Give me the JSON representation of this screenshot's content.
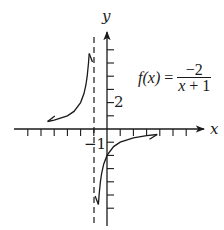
{
  "chart_data": {
    "type": "line",
    "title": "",
    "function_label": {
      "name": "f(x)",
      "equals": "=",
      "numerator": "−2",
      "denominator_var": "x",
      "denominator_rest": " + 1"
    },
    "xlabel": "x",
    "ylabel": "y",
    "tick_labels": {
      "y_2": "2",
      "x_neg1": "−1"
    },
    "grid": false,
    "legend": "none",
    "xlim": [
      -7,
      7
    ],
    "ylim": [
      -7,
      7
    ],
    "vertical_asymptote": {
      "x": -1,
      "style": "dashed"
    },
    "horizontal_asymptote": {
      "y": 0
    },
    "series": [
      {
        "name": "left branch (x < -1)",
        "x": [
          -4.5,
          -4,
          -3,
          -2.5,
          -2,
          -1.75,
          -1.6,
          -1.5,
          -1.4,
          -1.35
        ],
        "y": [
          0.57,
          0.67,
          1.0,
          1.33,
          2.0,
          2.67,
          3.33,
          4.0,
          5.0,
          5.71
        ]
      },
      {
        "name": "right branch (x > -1)",
        "x": [
          -0.65,
          -0.6,
          -0.5,
          -0.4,
          -0.25,
          0,
          0.5,
          1,
          2,
          3,
          3.8
        ],
        "y": [
          -5.71,
          -5.0,
          -4.0,
          -3.33,
          -2.67,
          -2.0,
          -1.33,
          -1.0,
          -0.67,
          -0.5,
          -0.42
        ]
      }
    ],
    "axis": {
      "origin_px": [
        107,
        129
      ],
      "unit_px": 13.2,
      "x_ticks": [
        -6,
        -5,
        -4,
        -3,
        -2,
        -1,
        1,
        2,
        3,
        4,
        5,
        6
      ],
      "y_ticks": [
        -6,
        -5,
        -4,
        -3,
        -2,
        -1,
        1,
        2,
        3,
        4,
        5,
        6
      ]
    }
  }
}
